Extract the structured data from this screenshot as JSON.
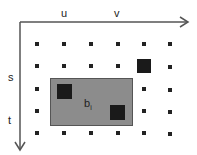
{
  "diagram": {
    "axis_labels": {
      "u": "u",
      "v": "v",
      "s": "s",
      "t": "t"
    },
    "region_label": "b",
    "region_subscript": "i",
    "colors": {
      "region": "#8c8c8c",
      "dot": "#222222",
      "block": "#1a1a1a"
    },
    "grid": {
      "rows": 5,
      "cols": 6
    }
  }
}
